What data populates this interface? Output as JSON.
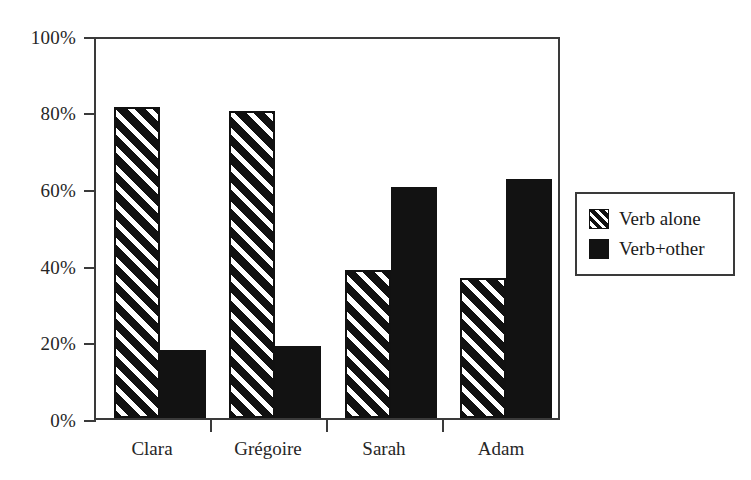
{
  "chart_data": {
    "type": "bar",
    "title": "",
    "xlabel": "",
    "ylabel": "",
    "categories": [
      "Clara",
      "Grégoire",
      "Sarah",
      "Adam"
    ],
    "series": [
      {
        "name": "Verb alone",
        "values": [
          82,
          81,
          39,
          37
        ],
        "pattern": "diagonal-hatch",
        "color": "#111111"
      },
      {
        "name": "Verb+other",
        "values": [
          18,
          19,
          61,
          63
        ],
        "pattern": "solid",
        "color": "#121212"
      }
    ],
    "ylim": [
      0,
      100
    ],
    "yticks": [
      0,
      20,
      40,
      60,
      80,
      100
    ],
    "ytick_labels": [
      "0%",
      "20%",
      "40%",
      "60%",
      "80%",
      "100%"
    ],
    "value_suffix": "%",
    "grid": false,
    "legend_position": "right",
    "legend_entries": [
      "Verb alone",
      "Verb+other"
    ],
    "axis_color": "#3a3a3a",
    "background": "#ffffff"
  },
  "axis": {
    "y_labels": [
      "100%",
      "80%",
      "60%",
      "40%",
      "20%",
      "0%"
    ],
    "x_labels": [
      "Clara",
      "Grégoire",
      "Sarah",
      "Adam"
    ]
  },
  "legend": {
    "items": [
      {
        "label": "Verb alone",
        "swatch": "hatched-swatch"
      },
      {
        "label": "Verb+other",
        "swatch": "solid-black-swatch"
      }
    ]
  }
}
